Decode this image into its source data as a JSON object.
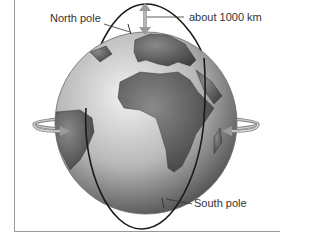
{
  "diagram": {
    "labels": {
      "north_pole": "North pole",
      "south_pole": "South pole",
      "altitude": "about 1000 km"
    },
    "colors": {
      "orbit": "#1a1a1a",
      "arrow": "#9a9a9a",
      "globe_light": "#e8e8e8",
      "globe_dark": "#5a5a5a",
      "land": "#6e6e6e",
      "frame": "#999999"
    }
  }
}
